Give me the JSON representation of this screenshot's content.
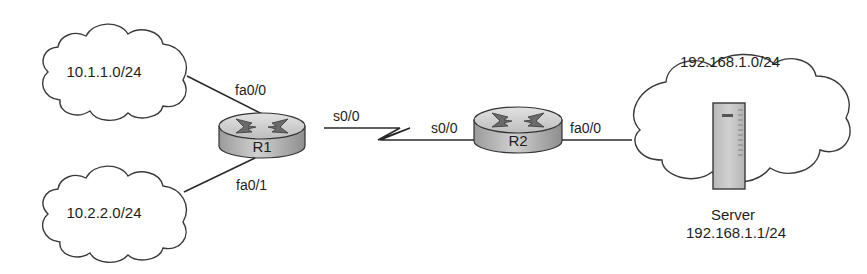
{
  "diagram": {
    "type": "network-topology",
    "clouds": [
      {
        "id": "net1",
        "label": "10.1.1.0/24"
      },
      {
        "id": "net2",
        "label": "10.2.2.0/24"
      },
      {
        "id": "net3",
        "label": "192.168.1.0/24"
      }
    ],
    "routers": [
      {
        "id": "R1",
        "label": "R1"
      },
      {
        "id": "R2",
        "label": "R2"
      }
    ],
    "server": {
      "label": "Server",
      "address": "192.168.1.1/24"
    },
    "interfaces": {
      "r1_fa00": "fa0/0",
      "r1_fa01": "fa0/1",
      "r1_s00": "s0/0",
      "r2_s00": "s0/0",
      "r2_fa00": "fa0/0"
    },
    "links": [
      {
        "from": "10.1.1.0/24",
        "to": "R1",
        "interface": "fa0/0",
        "type": "ethernet"
      },
      {
        "from": "10.2.2.0/24",
        "to": "R1",
        "interface": "fa0/1",
        "type": "ethernet"
      },
      {
        "from": "R1",
        "to": "R2",
        "interface_a": "s0/0",
        "interface_b": "s0/0",
        "type": "serial"
      },
      {
        "from": "R2",
        "to": "192.168.1.0/24",
        "interface": "fa0/0",
        "type": "ethernet"
      }
    ],
    "colors": {
      "line": "#2a2a2a",
      "router_fill": "#c9c9c9",
      "router_top": "#d6d6d6",
      "server_fill": "#c6c6c6",
      "cloud_fill": "#ffffff"
    }
  }
}
